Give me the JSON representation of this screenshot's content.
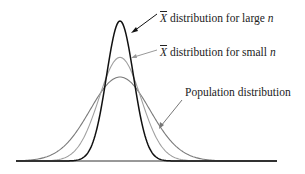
{
  "labels": {
    "large": {
      "symbol": "X",
      "text": " distribution for large ",
      "var": "n"
    },
    "small": {
      "symbol": "X",
      "text": " distribution for small ",
      "var": "n"
    },
    "population": {
      "text": "Population distribution"
    }
  },
  "colors": {
    "large_curve": "#111111",
    "small_curve": "#9a9a9a",
    "population_curve": "#7a7a7a",
    "baseline": "#333333"
  },
  "chart_data": {
    "type": "line",
    "title": "",
    "xlabel": "",
    "ylabel": "",
    "grid": false,
    "series": [
      {
        "name": "X̄ distribution for large n",
        "center": 0,
        "relative_sd": 0.45,
        "relative_peak": 1.0
      },
      {
        "name": "X̄ distribution for small n",
        "center": 0,
        "relative_sd": 0.7,
        "relative_peak": 0.74
      },
      {
        "name": "Population distribution",
        "center": 0,
        "relative_sd": 1.0,
        "relative_peak": 0.6
      }
    ]
  }
}
